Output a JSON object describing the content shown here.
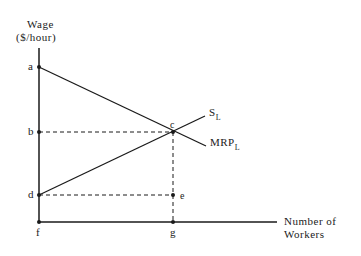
{
  "diagram": {
    "y_axis_label_line1": "Wage",
    "y_axis_label_line2": "($/hour)",
    "x_axis_label_line1": "Number of",
    "x_axis_label_line2": "Workers",
    "curves": {
      "supply": {
        "main": "S",
        "sub": "L"
      },
      "mrp": {
        "main": "MRP",
        "sub": "L"
      }
    },
    "points": {
      "a": "a",
      "b": "b",
      "c": "c",
      "d": "d",
      "e": "e",
      "f": "f",
      "g": "g"
    }
  }
}
